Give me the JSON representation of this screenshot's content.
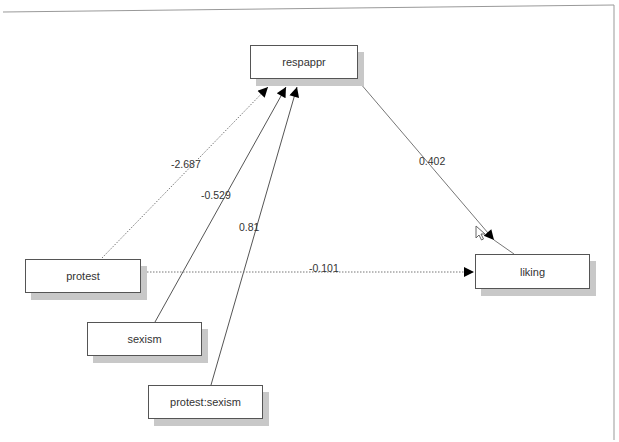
{
  "diagram": {
    "type": "path-model",
    "nodes": [
      {
        "id": "respappr",
        "label": "respappr",
        "x": 250,
        "y": 45,
        "w": 108,
        "h": 34
      },
      {
        "id": "protest",
        "label": "protest",
        "x": 25,
        "y": 259,
        "w": 116,
        "h": 34
      },
      {
        "id": "liking",
        "label": "liking",
        "x": 475,
        "y": 254,
        "w": 115,
        "h": 35
      },
      {
        "id": "sexism",
        "label": "sexism",
        "x": 87,
        "y": 322,
        "w": 115,
        "h": 34
      },
      {
        "id": "protest_sexism",
        "label": "protest:sexism",
        "x": 148,
        "y": 385,
        "w": 115,
        "h": 34
      }
    ],
    "edges": [
      {
        "from": "protest",
        "to": "respappr",
        "coef": "-2.687",
        "style": "dotted"
      },
      {
        "from": "sexism",
        "to": "respappr",
        "coef": "-0.529",
        "style": "solid"
      },
      {
        "from": "protest_sexism",
        "to": "respappr",
        "coef": "0.81",
        "style": "solid"
      },
      {
        "from": "respappr",
        "to": "liking",
        "coef": "0.402",
        "style": "solid"
      },
      {
        "from": "protest",
        "to": "liking",
        "coef": "-0.101",
        "style": "dotted"
      }
    ]
  },
  "colors": {
    "line": "#555555",
    "shadow": "#c8c8c8",
    "text": "#333333",
    "frame": "#999999"
  }
}
